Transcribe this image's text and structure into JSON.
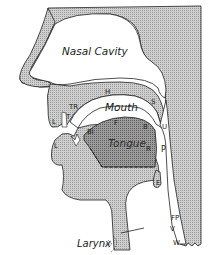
{
  "diagram": {
    "type": "sagittal section of human vocal tract",
    "colors": {
      "tissue_fill": "#c4c4c4",
      "tongue_fill": "#8f8f8f",
      "outline": "#222222",
      "background": "#ffffff"
    },
    "regions": {
      "nasal_cavity": "Nasal Cavity",
      "mouth": "Mouth",
      "tongue": "Tongue",
      "larynx": "Larynx"
    },
    "labels": {
      "upper_lip": "L",
      "lower_lip": "L",
      "teeth": "T",
      "teeth_ridge": "TR",
      "hard_palate": "H",
      "soft_palate": "S",
      "uvula": "U",
      "blade": "Bl",
      "front": "F",
      "back": "B",
      "root": "R",
      "pharynx": "P",
      "epiglottis": "E",
      "vocal_cords": "V",
      "windpipe": "W",
      "food_passage": "FP"
    }
  }
}
